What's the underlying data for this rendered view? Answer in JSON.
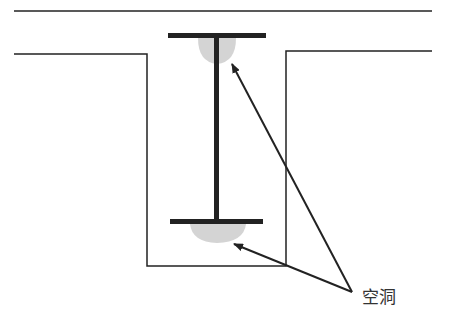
{
  "diagram": {
    "type": "cross-section",
    "colors": {
      "line": "#222222",
      "beam": "#222222",
      "void_fill": "#d4d4d4",
      "label": "#333333"
    },
    "label": {
      "text": "空洞",
      "x": 358,
      "y": 288
    }
  }
}
